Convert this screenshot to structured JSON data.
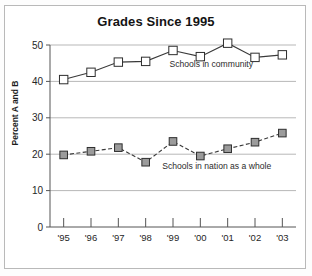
{
  "figure": {
    "title": "Grades Since 1995",
    "y_axis_title": "Percent A and B",
    "annotation_community": "Schools in community",
    "annotation_nation": "Schools in nation as a whole",
    "frame_color": "#b9b9b9",
    "gridline_color": "#9a9a9a",
    "line_color": "#3a3a3a",
    "marker_fill_community": "#ffffff",
    "marker_fill_nation": "#9b9b9b"
  },
  "chart_data": {
    "type": "line",
    "title": "Grades Since 1995",
    "xlabel": "",
    "ylabel": "Percent A and B",
    "categories": [
      "'95",
      "'96",
      "'97",
      "'98",
      "'99",
      "'00",
      "'01",
      "'02",
      "'03"
    ],
    "x": [
      1995,
      1996,
      1997,
      1998,
      1999,
      2000,
      2001,
      2002,
      2003
    ],
    "ylim": [
      0,
      50
    ],
    "yticks": [
      0,
      10,
      20,
      30,
      40,
      50
    ],
    "ytick_labels": [
      "0",
      "10",
      "20",
      "30",
      "40",
      "50"
    ],
    "grid": "horizontal",
    "legend": "inline-annotations",
    "series": [
      {
        "name": "Schools in community",
        "values": [
          40.5,
          42.5,
          45.3,
          45.5,
          48.5,
          46.8,
          50.5,
          46.6,
          47.3
        ],
        "marker": "open-square",
        "linestyle": "solid"
      },
      {
        "name": "Schools in nation as a whole",
        "values": [
          19.8,
          20.8,
          21.8,
          17.8,
          23.5,
          19.5,
          21.5,
          23.3,
          25.8
        ],
        "marker": "filled-square",
        "linestyle": "dashed"
      }
    ],
    "annotations": [
      {
        "text": "Schools in community",
        "x": 2000.4,
        "y": 44.0
      },
      {
        "text": "Schools in nation as a whole",
        "x": 2000.6,
        "y": 16.0
      }
    ]
  }
}
